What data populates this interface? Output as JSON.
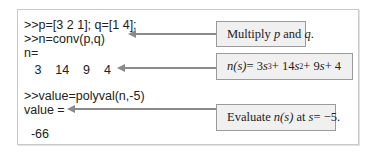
{
  "code_lines": {
    "line1": ">>p=[3 2 1]; q=[1 4];",
    "line2": ">>n=conv(p,q)",
    "line3": "n=",
    "line4": "   3    14    9    4",
    "line5": ">>value=polyval(n,-5)",
    "line6": "value =",
    "line7": "  -66"
  },
  "callouts": {
    "multiply": {
      "prefix": "Multiply ",
      "var1": "p",
      "mid": " and ",
      "var2": "q",
      "suffix": "."
    },
    "polynomial": {
      "lhs": "n(s)",
      "eq": " = 3",
      "s1": "s",
      "e1": "3",
      "t2": " + 14",
      "s2": "s",
      "e2": "2",
      "t3": " + 9",
      "s3": "s",
      "t4": " + 4"
    },
    "evaluate": {
      "prefix": "Evaluate ",
      "fn": "n(s)",
      "mid": " at ",
      "var": "s",
      "suffix": " = −5."
    }
  },
  "colors": {
    "frame_border": "#c9c9c9",
    "callout_bg": "#f0f0f0",
    "callout_border": "#9a9a9a",
    "arrow": "#8a8a8a"
  }
}
